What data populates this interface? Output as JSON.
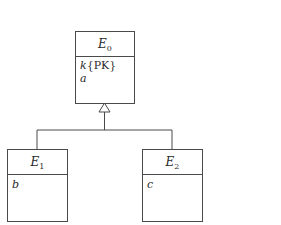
{
  "diagram": {
    "type": "uml-class-generalization",
    "entities": [
      {
        "id": "E0",
        "name": "E",
        "subscript": "0",
        "attributes": [
          {
            "name": "k",
            "suffix": "{PK}"
          },
          {
            "name": "a",
            "suffix": ""
          }
        ]
      },
      {
        "id": "E1",
        "name": "E",
        "subscript": "1",
        "attributes": [
          {
            "name": "b",
            "suffix": ""
          }
        ]
      },
      {
        "id": "E2",
        "name": "E",
        "subscript": "2",
        "attributes": [
          {
            "name": "c",
            "suffix": ""
          }
        ]
      }
    ],
    "relationships": [
      {
        "type": "generalization",
        "parent": "E0",
        "children": [
          "E1",
          "E2"
        ],
        "arrowhead": "hollow-triangle"
      }
    ]
  }
}
